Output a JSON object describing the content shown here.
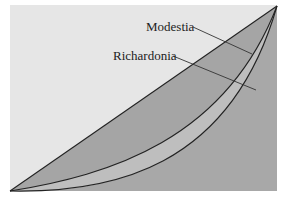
{
  "diagram": {
    "type": "lorenz-curve",
    "labels": {
      "upper_curve": "Modestia",
      "lower_curve": "Richardonia"
    },
    "colors": {
      "background_panel": "#e6e6e6",
      "region_between_diagonal_and_upper": "#a6a6a6",
      "region_between_curves": "#bdbdbd",
      "region_below_lower": "#a9a9a9",
      "line": "#222222"
    },
    "elements": [
      "line of perfect equality (diagonal)",
      "Modestia Lorenz curve",
      "Richardonia Lorenz curve"
    ]
  }
}
